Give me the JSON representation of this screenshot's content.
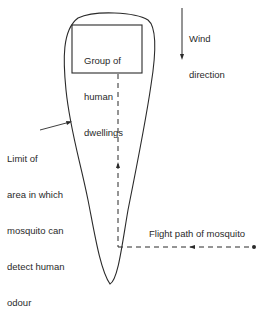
{
  "diagram": {
    "dwellings_box": {
      "lines": [
        "Group of",
        "human",
        "dwellings"
      ]
    },
    "wind": {
      "lines": [
        "Wind",
        "direction"
      ]
    },
    "limit_label": {
      "lines": [
        "Limit of",
        "area in which",
        "mosquito can",
        "detect human",
        "odour"
      ]
    },
    "flight_path_label": "Flight path of mosquito",
    "colors": {
      "stroke": "#2a2a2a",
      "background": "#ffffff"
    }
  }
}
